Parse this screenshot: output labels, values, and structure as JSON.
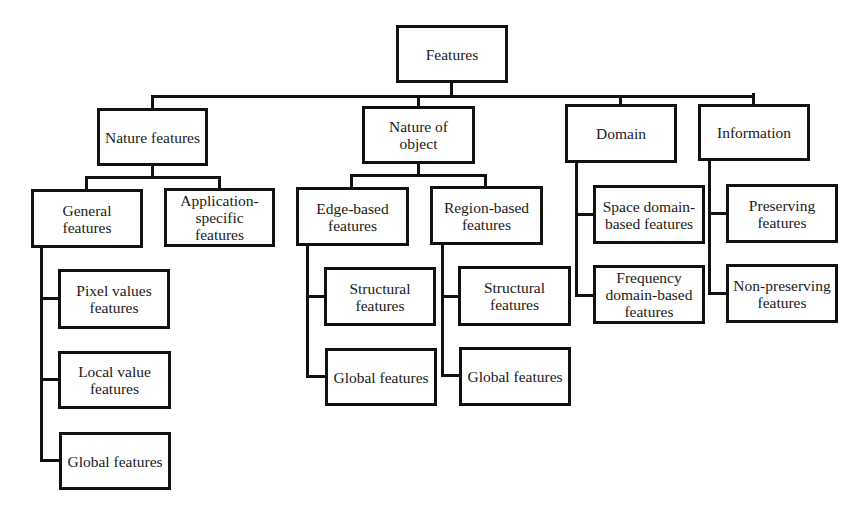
{
  "diagram": {
    "type": "hierarchy-tree",
    "root": "Features",
    "line_color": "#111111",
    "nodes": {
      "features": "Features",
      "nature_features": "Nature features",
      "nature_of_object": "Nature of\nobject",
      "domain": "Domain",
      "information": "Information",
      "general_features": "General\nfeatures",
      "application_specific": "Application-\nspecific\nfeatures",
      "edge_based": "Edge-based\nfeatures",
      "region_based": "Region-based\nfeatures",
      "space_domain": "Space domain-\nbased features",
      "preserving": "Preserving\nfeatures",
      "pixel_values": "Pixel values\nfeatures",
      "local_value": "Local value\nfeatures",
      "global_general": "Global features",
      "structural_edge": "Structural\nfeatures",
      "global_edge": "Global features",
      "structural_region": "Structural\nfeatures",
      "global_region": "Global features",
      "frequency_domain": "Frequency\ndomain-based\nfeatures",
      "non_preserving": "Non-preserving\nfeatures"
    },
    "edges": [
      [
        "features",
        "nature_features"
      ],
      [
        "features",
        "nature_of_object"
      ],
      [
        "features",
        "domain"
      ],
      [
        "features",
        "information"
      ],
      [
        "nature_features",
        "general_features"
      ],
      [
        "nature_features",
        "application_specific"
      ],
      [
        "general_features",
        "pixel_values"
      ],
      [
        "general_features",
        "local_value"
      ],
      [
        "general_features",
        "global_general"
      ],
      [
        "nature_of_object",
        "edge_based"
      ],
      [
        "nature_of_object",
        "region_based"
      ],
      [
        "edge_based",
        "structural_edge"
      ],
      [
        "edge_based",
        "global_edge"
      ],
      [
        "region_based",
        "structural_region"
      ],
      [
        "region_based",
        "global_region"
      ],
      [
        "domain",
        "space_domain"
      ],
      [
        "domain",
        "frequency_domain"
      ],
      [
        "information",
        "preserving"
      ],
      [
        "information",
        "non_preserving"
      ]
    ]
  }
}
